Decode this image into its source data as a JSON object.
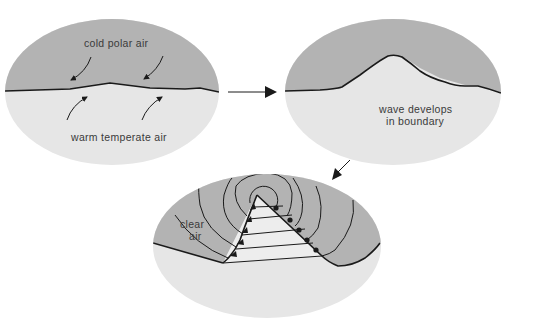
{
  "colors": {
    "cold_air": "#b3b3b3",
    "warm_air": "#e6e6e6",
    "warm_sector": "#ededed",
    "line": "#1a1a1a",
    "text": "#3a3a3a",
    "background": "#ffffff"
  },
  "panels": [
    {
      "id": "stage-1",
      "labels": {
        "top": "cold polar air",
        "bottom": "warm temperate air"
      }
    },
    {
      "id": "stage-2",
      "labels": {
        "line1": "wave develops",
        "line2": "in boundary"
      }
    },
    {
      "id": "stage-3",
      "labels": {
        "line1": "clear",
        "line2": "air"
      }
    }
  ],
  "arrows": [
    {
      "from": "stage-1",
      "to": "stage-2",
      "direction": "right"
    },
    {
      "from": "stage-2",
      "to": "stage-3",
      "direction": "down-left"
    }
  ]
}
